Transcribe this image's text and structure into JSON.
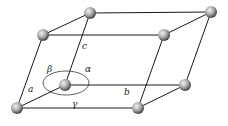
{
  "diagram": {
    "edge_labels": {
      "a": "a",
      "b": "b",
      "c": "c"
    },
    "angle_labels": {
      "alpha": "α",
      "beta": "β",
      "gamma": "γ"
    },
    "atom_count": 8,
    "colors": {
      "line": "#1a1a1a",
      "atom_light": "#e6e6e6",
      "atom_dark": "#555555",
      "background": "#ffffff"
    }
  }
}
